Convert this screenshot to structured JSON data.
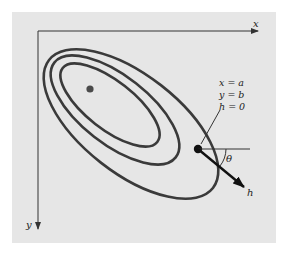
{
  "figure": {
    "background_color": "#e6e6e6",
    "line_color": "#3a3a3a",
    "axes": {
      "x_label": "x",
      "y_label": "y"
    },
    "contours": {
      "count": 3,
      "description": "Elliptical contour lines tilted downward to the right"
    },
    "optimum_point": {
      "description": "Dot at the center of the innermost contour"
    },
    "start_point": {
      "labels": [
        "x = a",
        "y = b",
        "h = 0"
      ]
    },
    "direction": {
      "angle_label": "θ",
      "vector_label": "h"
    }
  }
}
